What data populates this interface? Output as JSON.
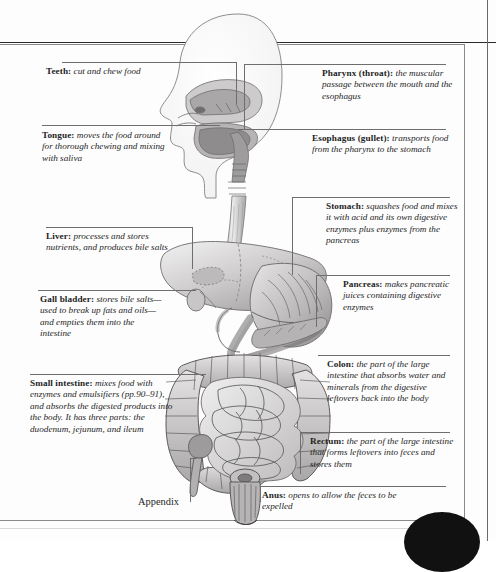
{
  "page": {
    "background_color": "#fdfdfd",
    "border_color": "#8a8a8a",
    "text_color": "#1f1f1f"
  },
  "labels_left": [
    {
      "id": "teeth",
      "head": "Teeth:",
      "body": " cut and chew food"
    },
    {
      "id": "tongue",
      "head": "Tongue:",
      "body": " moves the food around for thorough chewing and mixing with saliva"
    },
    {
      "id": "liver",
      "head": "Liver:",
      "body": " processes and stores nutrients, and produces bile salts"
    },
    {
      "id": "gall-bladder",
      "head": "Gall bladder:",
      "body": " stores bile salts—used to break up fats and oils—and empties them into the intestine"
    },
    {
      "id": "small-intestine",
      "head": "Small intestine:",
      "body": " mixes food with enzymes and emulsifiers (pp.90–91), and absorbs the digested products into the body. It has three parts: the duodenum, jejunum, and ileum"
    }
  ],
  "labels_right": [
    {
      "id": "pharynx",
      "head": "Pharynx (throat):",
      "body": " the muscular passage between the mouth and the esophagus"
    },
    {
      "id": "esophagus",
      "head": "Esophagus (gullet):",
      "body": " transports food from the pharynx to the stomach"
    },
    {
      "id": "stomach",
      "head": "Stomach:",
      "body": " squashes food and mixes it with acid and its own digestive enzymes plus enzymes from the pancreas"
    },
    {
      "id": "pancreas",
      "head": "Pancreas:",
      "body": " makes pancreatic juices containing digestive enzymes"
    },
    {
      "id": "colon",
      "head": "Colon:",
      "body": " the part of the large intestine that absorbs water and minerals from the digestive leftovers back into the body"
    },
    {
      "id": "rectum",
      "head": "Rectum:",
      "body": " the part of the large intestine that forms leftovers into feces and stores them"
    },
    {
      "id": "anus",
      "head": "Anus:",
      "body": " opens to allow the feces to be expelled"
    }
  ],
  "labels_plain": [
    {
      "id": "appendix",
      "text": "Appendix"
    }
  ],
  "illustration": {
    "name": "human-digestive-system",
    "parts": [
      "head-sagittal-section",
      "nasal-cavity",
      "tongue",
      "pharynx",
      "esophagus",
      "liver",
      "gall-bladder",
      "stomach",
      "pancreas",
      "duodenum",
      "small-intestine",
      "colon",
      "appendix",
      "rectum",
      "anus"
    ],
    "style": "grayscale-engraving"
  }
}
